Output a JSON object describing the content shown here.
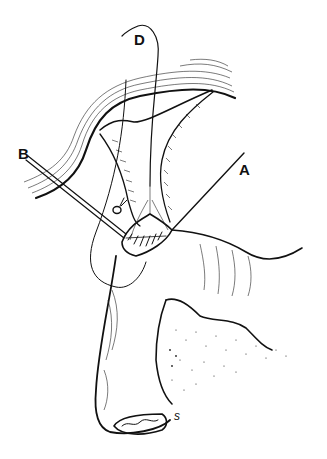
{
  "figure": {
    "type": "surgical-illustration",
    "labels": [
      {
        "id": "D",
        "text": "D",
        "x": 134,
        "y": 32
      },
      {
        "id": "B",
        "text": "B",
        "x": 18,
        "y": 146
      },
      {
        "id": "A",
        "text": "A",
        "x": 239,
        "y": 162
      }
    ],
    "annotations": [
      {
        "id": "s-mark",
        "text": "s",
        "x": 174,
        "y": 413
      }
    ],
    "colors": {
      "ink": "#111111",
      "background": "#ffffff"
    }
  }
}
